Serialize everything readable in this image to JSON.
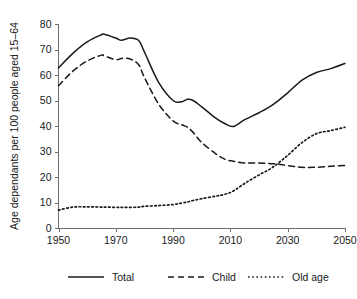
{
  "chart_data": {
    "type": "line",
    "title": "",
    "subtitle": "",
    "xlabel": "",
    "ylabel": "Age dependants per 100 people aged 15–64",
    "xlim": [
      1950,
      2050
    ],
    "ylim": [
      0,
      80
    ],
    "grid": false,
    "legend_position": "bottom",
    "xticks": [
      1950,
      1970,
      1990,
      2010,
      2030,
      2050
    ],
    "xtick_labels": [
      "1950",
      "1970",
      "1990",
      "2010",
      "2030",
      "2050"
    ],
    "yticks": [
      0,
      10,
      20,
      30,
      40,
      50,
      60,
      70,
      80
    ],
    "ytick_labels": [
      "0",
      "10",
      "20",
      "30",
      "40",
      "50",
      "60",
      "70",
      "80"
    ],
    "x": [
      1950,
      1955,
      1960,
      1965,
      1966,
      1970,
      1972,
      1975,
      1978,
      1980,
      1985,
      1990,
      1993,
      1995,
      1997,
      2000,
      2005,
      2008,
      2011,
      2015,
      2020,
      2025,
      2030,
      2035,
      2040,
      2045,
      2050
    ],
    "series": [
      {
        "name": "Total",
        "style": "solid",
        "color": "#1a1a1a",
        "values": [
          62.8,
          68.5,
          73.0,
          75.8,
          76.0,
          74.5,
          73.6,
          74.5,
          73.5,
          69.0,
          57.0,
          50.0,
          49.5,
          50.5,
          50.0,
          47.5,
          43.0,
          41.0,
          39.8,
          42.5,
          45.2,
          48.5,
          53.0,
          58.0,
          61.0,
          62.5,
          64.5
        ]
      },
      {
        "name": "Child",
        "style": "dashed",
        "color": "#1a1a1a",
        "values": [
          55.8,
          61.5,
          65.5,
          67.8,
          67.5,
          66.0,
          66.5,
          66.3,
          64.0,
          59.0,
          48.5,
          42.0,
          40.5,
          39.5,
          37.5,
          33.5,
          29.0,
          27.0,
          26.2,
          25.5,
          25.5,
          25.2,
          24.5,
          23.8,
          23.8,
          24.2,
          24.5
        ]
      },
      {
        "name": "Old age",
        "style": "dotted",
        "color": "#1a1a1a",
        "values": [
          7.0,
          8.2,
          8.3,
          8.2,
          8.2,
          8.1,
          8.1,
          8.1,
          8.2,
          8.5,
          8.8,
          9.2,
          9.8,
          10.2,
          10.8,
          11.5,
          12.5,
          13.2,
          14.5,
          17.5,
          20.8,
          24.0,
          28.5,
          33.5,
          37.0,
          38.2,
          39.5
        ]
      }
    ],
    "legend": [
      {
        "label": "Total",
        "style": "solid"
      },
      {
        "label": "Child",
        "style": "dashed"
      },
      {
        "label": "Old age",
        "style": "dotted"
      }
    ]
  },
  "axis": {
    "y_title": "Age dependants per 100 people aged 15–64"
  }
}
